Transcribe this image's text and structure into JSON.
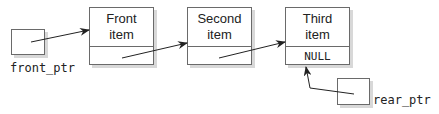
{
  "diagram": {
    "type": "linked-list queue",
    "nodes": [
      {
        "line1": "Front",
        "line2": "item",
        "next": ""
      },
      {
        "line1": "Second",
        "line2": "item",
        "next": ""
      },
      {
        "line1": "Third",
        "line2": "item",
        "next": "NULL"
      }
    ],
    "pointers": {
      "front": {
        "label": "front_ptr",
        "target": "Front item"
      },
      "rear": {
        "label": "rear_ptr",
        "target": "Third item"
      }
    },
    "colors": {
      "stroke": "#6a6a6a",
      "shadow": "#d8d8d8",
      "text": "#222222"
    }
  }
}
